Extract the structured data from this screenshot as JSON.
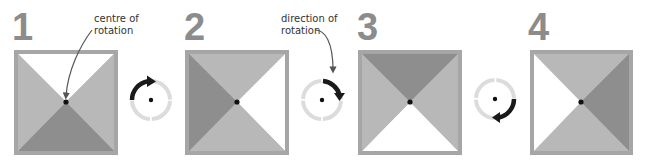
{
  "diagram": {
    "colors": {
      "border": "#a6a6a6",
      "white": "#ffffff",
      "light": "#b8b8b8",
      "dark": "#8e8e8e",
      "ring": "#dcdcdc",
      "arrow": "#1a1a1a",
      "number": "#8c8c8c"
    },
    "panels": [
      {
        "number": "1",
        "top": "white",
        "right": "light",
        "bottom": "dark",
        "left": "light"
      },
      {
        "number": "2",
        "top": "light",
        "right": "white",
        "bottom": "light",
        "left": "dark"
      },
      {
        "number": "3",
        "top": "dark",
        "right": "light",
        "bottom": "white",
        "left": "light"
      },
      {
        "number": "4",
        "top": "light",
        "right": "dark",
        "bottom": "light",
        "left": "white"
      }
    ],
    "annotations": {
      "centre_label_line1": "centre of",
      "centre_label_line2": "rotation",
      "direction_label_line1": "direction of",
      "direction_label_line2": "rotation"
    },
    "rotation_indicators": [
      {
        "position": "between 1 and 2",
        "arc": "top-left quarter",
        "direction": "clockwise"
      },
      {
        "position": "between 2 and 3",
        "arc": "top-right quarter",
        "direction": "clockwise"
      },
      {
        "position": "between 3 and 4",
        "arc": "bottom-right quarter",
        "direction": "clockwise"
      }
    ]
  }
}
